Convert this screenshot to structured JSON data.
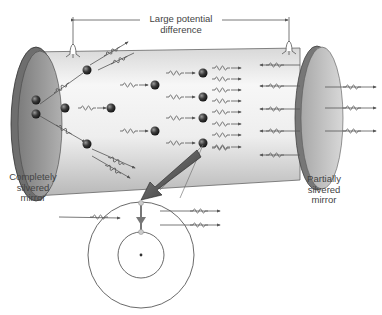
{
  "labels": {
    "voltage": [
      "Large potential",
      "difference"
    ],
    "left_mirror": [
      "Completely",
      "silvered",
      "mirror"
    ],
    "right_mirror": [
      "Partially",
      "silvered",
      "mirror"
    ]
  },
  "colors": {
    "tube_light": "#f4f4f4",
    "tube_dark": "#bdbdbd",
    "mirror": "#9a9a9a",
    "atom": "#3a3a3a",
    "line": "#555555",
    "pointer_arrow": "#555555"
  },
  "components": {
    "tube": "gas discharge tube",
    "electrodes": 2,
    "atoms_in_tube": 11,
    "inset": "atom energy-level diagram with electron transition from outer to inner orbit emitting photon (stimulated emission)"
  }
}
